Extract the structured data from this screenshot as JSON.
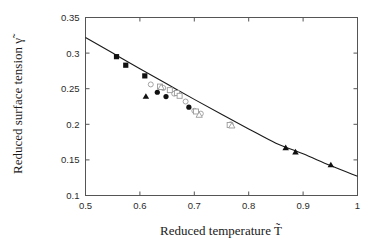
{
  "figure": {
    "background_color": "#ffffff",
    "frame_color": "#555555",
    "curve_color": "#1a1a1a",
    "filled_marker_color": "#111111",
    "open_marker_color": "#9a9a9a"
  },
  "chart_data": {
    "type": "scatter",
    "title": "",
    "subtitle": "",
    "xlabel": "Reduced temperature T̃",
    "ylabel": "Reduced surface tension γ̃",
    "xlim": [
      0.5,
      1.0
    ],
    "ylim": [
      0.1,
      0.35
    ],
    "xticks": [
      0.5,
      0.6,
      0.7,
      0.8,
      0.9,
      1.0
    ],
    "xtick_labels": [
      "0.5",
      "0.6",
      "0.7",
      "0.8",
      "0.9",
      "1"
    ],
    "yticks": [
      0.1,
      0.15,
      0.2,
      0.25,
      0.3,
      0.35
    ],
    "ytick_labels": [
      "0.1",
      "0.15",
      "0.2",
      "0.25",
      "0.3",
      "0.35"
    ],
    "grid": false,
    "legend": "none",
    "annotations": [],
    "series": [
      {
        "name": "filled-square",
        "marker": "filled-square",
        "points": [
          {
            "x": 0.557,
            "y": 0.295
          },
          {
            "x": 0.574,
            "y": 0.283
          },
          {
            "x": 0.609,
            "y": 0.268
          }
        ]
      },
      {
        "name": "filled-circle",
        "marker": "filled-circle",
        "points": [
          {
            "x": 0.632,
            "y": 0.245
          },
          {
            "x": 0.648,
            "y": 0.239
          },
          {
            "x": 0.69,
            "y": 0.224
          }
        ]
      },
      {
        "name": "filled-triangle",
        "marker": "filled-triangle",
        "points": [
          {
            "x": 0.611,
            "y": 0.239
          },
          {
            "x": 0.868,
            "y": 0.167
          },
          {
            "x": 0.886,
            "y": 0.161
          },
          {
            "x": 0.951,
            "y": 0.143
          }
        ]
      },
      {
        "name": "open-circle",
        "marker": "open-circle",
        "points": [
          {
            "x": 0.62,
            "y": 0.256
          },
          {
            "x": 0.643,
            "y": 0.251
          },
          {
            "x": 0.663,
            "y": 0.243
          },
          {
            "x": 0.684,
            "y": 0.232
          },
          {
            "x": 0.7,
            "y": 0.219
          },
          {
            "x": 0.712,
            "y": 0.215
          },
          {
            "x": 0.767,
            "y": 0.2
          }
        ]
      },
      {
        "name": "open-square",
        "marker": "open-square",
        "points": [
          {
            "x": 0.637,
            "y": 0.253
          },
          {
            "x": 0.655,
            "y": 0.248
          },
          {
            "x": 0.668,
            "y": 0.244
          },
          {
            "x": 0.673,
            "y": 0.24
          },
          {
            "x": 0.703,
            "y": 0.218
          },
          {
            "x": 0.765,
            "y": 0.199
          }
        ]
      },
      {
        "name": "open-triangle",
        "marker": "open-triangle",
        "points": [
          {
            "x": 0.639,
            "y": 0.252
          },
          {
            "x": 0.709,
            "y": 0.213
          },
          {
            "x": 0.769,
            "y": 0.198
          }
        ]
      }
    ],
    "curve": {
      "name": "model-curve",
      "style": "solid",
      "points": [
        {
          "x": 0.5,
          "y": 0.322
        },
        {
          "x": 0.55,
          "y": 0.3
        },
        {
          "x": 0.6,
          "y": 0.278
        },
        {
          "x": 0.65,
          "y": 0.2565
        },
        {
          "x": 0.7,
          "y": 0.235
        },
        {
          "x": 0.75,
          "y": 0.214
        },
        {
          "x": 0.8,
          "y": 0.1935
        },
        {
          "x": 0.85,
          "y": 0.1735
        },
        {
          "x": 0.9,
          "y": 0.1585
        },
        {
          "x": 0.95,
          "y": 0.142
        },
        {
          "x": 1.0,
          "y": 0.127
        }
      ]
    }
  }
}
